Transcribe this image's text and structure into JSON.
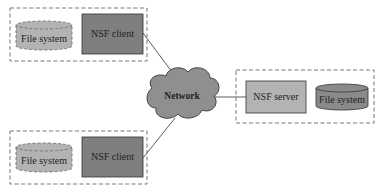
{
  "diagram": {
    "network": {
      "label": "Network",
      "fill": "#8f8f8f"
    },
    "client_top": {
      "client_label": "NSF client",
      "fs_label": "File system",
      "client_fill": "#7f7f7f",
      "fs_fill": "#b3b3b3"
    },
    "client_bottom": {
      "client_label": "NSF client",
      "fs_label": "File system",
      "client_fill": "#7f7f7f",
      "fs_fill": "#b3b3b3"
    },
    "server": {
      "server_label": "NSF server",
      "fs_label": "File system",
      "server_fill": "#b3b3b3",
      "fs_fill": "#8a8a8a"
    },
    "edges": [
      {
        "from": "client_top",
        "to": "network"
      },
      {
        "from": "client_bottom",
        "to": "network"
      },
      {
        "from": "network",
        "to": "server"
      }
    ]
  }
}
